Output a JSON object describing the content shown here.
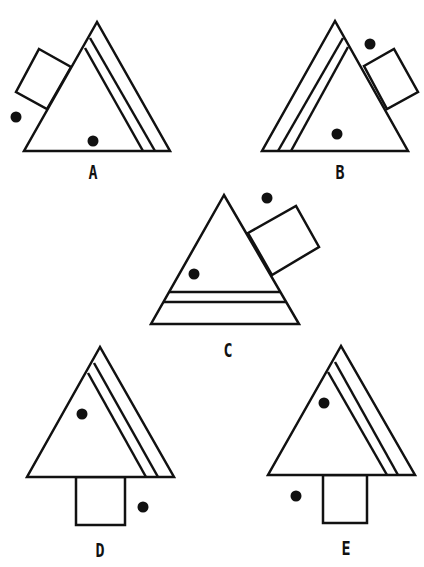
{
  "puzzle": {
    "stroke_color": "#111111",
    "background": "#ffffff",
    "options": [
      {
        "label": "A",
        "label_pos": [
          93,
          162
        ],
        "triangle": [
          [
            97,
            22
          ],
          [
            24,
            151
          ],
          [
            170,
            151
          ]
        ],
        "inner_lines": [
          [
            [
              90,
              38
            ],
            [
              155,
              151
            ]
          ],
          [
            [
              85,
              48
            ],
            [
              143,
              151
            ]
          ]
        ],
        "square": [
          [
            39,
            49
          ],
          [
            71,
            67
          ],
          [
            47,
            109
          ],
          [
            16,
            92
          ]
        ],
        "dots": [
          [
            16,
            117
          ],
          [
            93,
            141
          ]
        ]
      },
      {
        "label": "B",
        "label_pos": [
          340,
          162
        ],
        "triangle": [
          [
            335,
            21
          ],
          [
            262,
            151
          ],
          [
            408,
            151
          ]
        ],
        "inner_lines": [
          [
            [
              343,
              38
            ],
            [
              278,
              151
            ]
          ],
          [
            [
              348,
              47
            ],
            [
              291,
              151
            ]
          ]
        ],
        "square": [
          [
            364,
            66
          ],
          [
            394,
            49
          ],
          [
            418,
            92
          ],
          [
            387,
            109
          ]
        ],
        "dots": [
          [
            370,
            44
          ],
          [
            337,
            134
          ]
        ]
      },
      {
        "label": "C",
        "label_pos": [
          228,
          340
        ],
        "triangle": [
          [
            224,
            195
          ],
          [
            151,
            324
          ],
          [
            299,
            324
          ]
        ],
        "inner_lines": [
          [
            [
              169,
              292
            ],
            [
              280,
              292
            ]
          ],
          [
            [
              163,
              302
            ],
            [
              286,
              302
            ]
          ]
        ],
        "square": [
          [
            248,
            233
          ],
          [
            296,
            206
          ],
          [
            319,
            247
          ],
          [
            272,
            275
          ]
        ],
        "dots": [
          [
            267,
            198
          ],
          [
            194,
            274
          ]
        ]
      },
      {
        "label": "D",
        "label_pos": [
          100,
          540
        ],
        "triangle": [
          [
            100,
            347
          ],
          [
            27,
            477
          ],
          [
            174,
            477
          ]
        ],
        "inner_lines": [
          [
            [
              94,
              363
            ],
            [
              158,
              477
            ]
          ],
          [
            [
              88,
              373
            ],
            [
              146,
              477
            ]
          ]
        ],
        "square": [
          [
            76,
            477
          ],
          [
            125,
            477
          ],
          [
            125,
            525
          ],
          [
            76,
            525
          ]
        ],
        "dots": [
          [
            82,
            414
          ],
          [
            143,
            507
          ]
        ]
      },
      {
        "label": "E",
        "label_pos": [
          346,
          538
        ],
        "triangle": [
          [
            341,
            346
          ],
          [
            268,
            475
          ],
          [
            415,
            475
          ]
        ],
        "inner_lines": [
          [
            [
              335,
              362
            ],
            [
              398,
              475
            ]
          ],
          [
            [
              328,
              372
            ],
            [
              387,
              475
            ]
          ]
        ],
        "square": [
          [
            323,
            475
          ],
          [
            367,
            475
          ],
          [
            367,
            523
          ],
          [
            323,
            523
          ]
        ],
        "dots": [
          [
            324,
            403
          ],
          [
            296,
            496
          ]
        ]
      }
    ]
  }
}
